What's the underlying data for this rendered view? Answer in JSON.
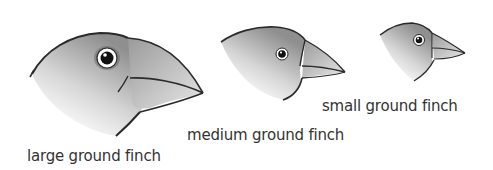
{
  "finches": [
    {
      "name": "large ground finch",
      "size": "large"
    },
    {
      "name": "medium ground finch",
      "size": "medium"
    },
    {
      "name": "small ground finch",
      "size": "small"
    }
  ],
  "colors": {
    "outline": "#2a2a2a",
    "head_dark": "#8a8a8a",
    "head_light": "#ffffff",
    "beak": "#c4c4c4",
    "text": "#333333"
  }
}
